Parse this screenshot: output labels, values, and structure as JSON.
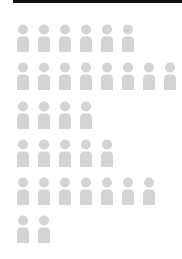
{
  "topbar": {
    "color": "#111111"
  },
  "icon": {
    "name": "person-icon",
    "color": "#d4d4d4"
  },
  "chart_data": {
    "type": "pictograph",
    "title": "",
    "unit": "person",
    "categories": [
      "Row 1",
      "Row 2",
      "Row 3",
      "Row 4",
      "Row 5",
      "Row 6"
    ],
    "values": [
      6,
      8,
      4,
      5,
      7,
      2
    ],
    "total": 32,
    "legend": [],
    "xlabel": "",
    "ylabel": ""
  }
}
